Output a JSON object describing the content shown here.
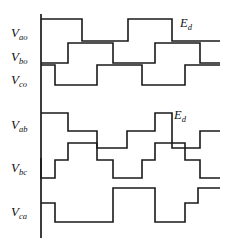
{
  "figure": {
    "stroke_color": "#1a1a1a",
    "background": "#ffffff",
    "axis_x": 41,
    "plot_right": 220,
    "period_start": 41,
    "period_end": 213,
    "step_width": 28.7
  },
  "labels": {
    "v_ao": {
      "base": "V",
      "sub": "ao"
    },
    "v_bo": {
      "base": "V",
      "sub": "bo"
    },
    "v_co": {
      "base": "V",
      "sub": "co"
    },
    "v_ab": {
      "base": "V",
      "sub": "ab"
    },
    "v_bc": {
      "base": "V",
      "sub": "bc"
    },
    "v_ca": {
      "base": "V",
      "sub": "ca"
    },
    "ed_top": {
      "base": "E",
      "sub": "d"
    },
    "ed_mid": {
      "base": "E",
      "sub": "d"
    }
  },
  "chart_data": {
    "type": "line",
    "xlabel": "",
    "ylabel": "",
    "grid": false,
    "legend": "none",
    "annotations": [
      {
        "text": "Ed",
        "target": "V_ao",
        "meaning": "amplitude of pole voltage step"
      },
      {
        "text": "Ed",
        "target": "V_ab",
        "meaning": "amplitude of line voltage step"
      }
    ],
    "x_unit": "60-degree step",
    "x": [
      0,
      1,
      2,
      3,
      4,
      5,
      6
    ],
    "series": [
      {
        "name": "V_ao",
        "kind": "pole",
        "levels": [
          1,
          1,
          0,
          0,
          1,
          1
        ],
        "ylim": [
          0,
          1
        ]
      },
      {
        "name": "V_bo",
        "kind": "pole",
        "levels": [
          0,
          1,
          1,
          0,
          0,
          1
        ],
        "ylim": [
          0,
          1
        ]
      },
      {
        "name": "V_co",
        "kind": "pole",
        "levels": [
          1,
          0,
          1,
          1,
          0,
          0
        ],
        "ylim": [
          0,
          1
        ]
      },
      {
        "name": "V_ab",
        "kind": "line",
        "levels": [
          1,
          0,
          -1,
          -1,
          1,
          0
        ],
        "ylim": [
          -1,
          1
        ]
      },
      {
        "name": "V_bc",
        "kind": "line",
        "levels": [
          -1,
          0,
          1,
          0,
          -1,
          0
        ],
        "ylim": [
          -1,
          1
        ]
      },
      {
        "name": "V_ca",
        "kind": "line",
        "levels": [
          0,
          -1,
          0,
          1,
          0,
          -1
        ],
        "ylim": [
          -1,
          1
        ]
      }
    ]
  },
  "waveforms": {
    "v_ao": "M41,19 L82,19 L82,41 L128,41 L128,19 L172,19 L172,41 L220,41",
    "v_bo": "M41,63 L68,63 L68,43 L113,43 L113,63 L155,63 L155,43 L200,43 L200,63 L220,63",
    "v_co": "M41,65 L55,65 L55,85 L97,85 L97,65 L142,65 L142,85 L185,85 L185,65 L220,65",
    "v_ab": "M41,113 L68,113 L68,131 L97,131 L97,148 L127,148 L127,131 L155,131 L155,113 L172,113 L172,131 L172,148 L200,148 L200,131 L220,131",
    "v_bc": "M41,158 L41,178 L55,178 L55,160 L68,160 L68,143 L97,143 L97,160 L113,160 L113,178 L142,178 L142,160 L155,160 L155,143 L185,143 L185,160 L200,160 L200,178 L220,178",
    "v_ca": "M41,203 L55,203 L55,222 L113,222 L113,203 L113,188 L155,188 L155,203 L155,222 L185,222 L185,203 L198,203 L198,188 L220,188"
  },
  "axis": {
    "vertical": "M41,14 L41,238",
    "description": "vertical time-origin axis"
  }
}
